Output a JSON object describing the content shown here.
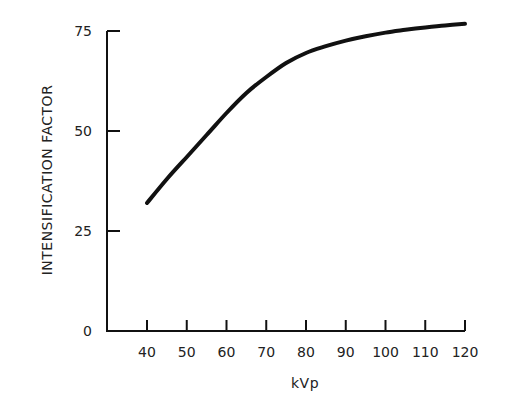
{
  "chart_data": {
    "type": "line",
    "title": "",
    "xlabel": "kVp",
    "ylabel": "INTENSIFICATION FACTOR",
    "xlim": [
      31,
      120
    ],
    "ylim": [
      0,
      75
    ],
    "x_ticks": [
      40,
      50,
      60,
      70,
      80,
      90,
      100,
      110,
      120
    ],
    "y_ticks": [
      0,
      25,
      50,
      75
    ],
    "grid": false,
    "legend": null,
    "series": [
      {
        "name": "Intensification factor",
        "x": [
          40,
          45,
          50,
          55,
          60,
          65,
          70,
          75,
          80,
          85,
          90,
          95,
          100,
          105,
          110,
          115,
          120
        ],
        "y": [
          32,
          38,
          43.5,
          49,
          54.5,
          59.5,
          63.5,
          67,
          69.5,
          71.2,
          72.6,
          73.7,
          74.6,
          75.3,
          75.9,
          76.4,
          76.8
        ]
      }
    ]
  },
  "axes": {
    "x_title": "kVp",
    "y_title": "INTENSIFICATION FACTOR",
    "x_tick_labels": [
      "40",
      "50",
      "60",
      "70",
      "80",
      "90",
      "100",
      "110",
      "120"
    ],
    "y_tick_labels": [
      "0",
      "25",
      "50",
      "75"
    ]
  }
}
